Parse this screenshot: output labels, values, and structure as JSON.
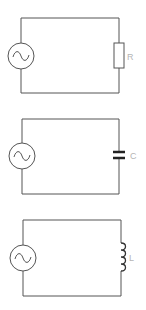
{
  "diagram": {
    "stroke_color": "#555555",
    "label_color": "#b5b5b5",
    "circuits": [
      {
        "name": "resistor-circuit",
        "source": "ac-source",
        "component": "resistor",
        "label": "R",
        "frame": {
          "left": 21,
          "top": 18,
          "right": 119,
          "bottom": 93
        },
        "source_center": [
          21,
          56
        ]
      },
      {
        "name": "capacitor-circuit",
        "source": "ac-source",
        "component": "capacitor",
        "label": "C",
        "frame": {
          "left": 22,
          "top": 119,
          "right": 119,
          "bottom": 194
        },
        "source_center": [
          22,
          156
        ]
      },
      {
        "name": "inductor-circuit",
        "source": "ac-source",
        "component": "inductor",
        "label": "L",
        "frame": {
          "left": 23,
          "top": 220,
          "right": 121,
          "bottom": 296
        },
        "source_center": [
          23,
          258
        ]
      }
    ]
  }
}
